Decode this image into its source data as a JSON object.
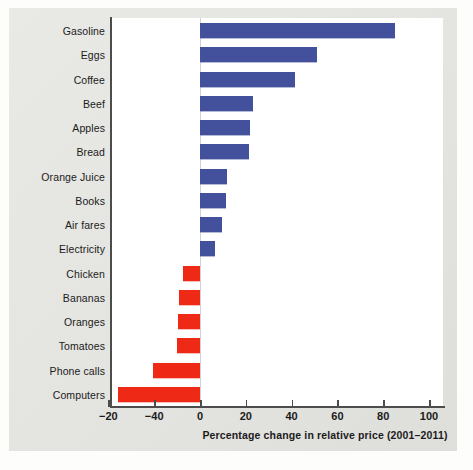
{
  "chart_data": {
    "type": "bar",
    "orientation": "horizontal",
    "title": "",
    "xlabel": "Percentage change in relative price (2001–2011)",
    "ylabel": "",
    "xlim": [
      -45,
      105
    ],
    "grid": false,
    "legend": null,
    "zero_reference_line": true,
    "axis_tick_labels": [
      "−20",
      "−40",
      "0",
      "20",
      "40",
      "60",
      "80",
      "100"
    ],
    "axis_tick_values": [
      -40,
      -20,
      0,
      20,
      40,
      60,
      80,
      100
    ],
    "colors": {
      "positive": "#43509c",
      "negative": "#ee2a17",
      "panel_background": "#e6e6e2",
      "plot_background": "#ffffff",
      "axis": "#4c4c4c"
    },
    "categories": [
      "Gasoline",
      "Eggs",
      "Coffee",
      "Beef",
      "Apples",
      "Bread",
      "Orange Juice",
      "Books",
      "Air fares",
      "Electricity",
      "Chicken",
      "Bananas",
      "Oranges",
      "Tomatoes",
      "Phone calls",
      "Computers"
    ],
    "values": [
      85,
      51,
      41.5,
      23,
      22,
      21.5,
      12,
      11.5,
      9.5,
      6.5,
      -7.5,
      -9,
      -9.5,
      -10,
      -20.5,
      -36
    ],
    "points": [
      {
        "label": "Gasoline",
        "value": 85,
        "sign": "positive"
      },
      {
        "label": "Eggs",
        "value": 51,
        "sign": "positive"
      },
      {
        "label": "Coffee",
        "value": 41.5,
        "sign": "positive"
      },
      {
        "label": "Beef",
        "value": 23,
        "sign": "positive"
      },
      {
        "label": "Apples",
        "value": 22,
        "sign": "positive"
      },
      {
        "label": "Bread",
        "value": 21.5,
        "sign": "positive"
      },
      {
        "label": "Orange Juice",
        "value": 12,
        "sign": "positive"
      },
      {
        "label": "Books",
        "value": 11.5,
        "sign": "positive"
      },
      {
        "label": "Air fares",
        "value": 9.5,
        "sign": "positive"
      },
      {
        "label": "Electricity",
        "value": 6.5,
        "sign": "positive"
      },
      {
        "label": "Chicken",
        "value": -7.5,
        "sign": "negative"
      },
      {
        "label": "Bananas",
        "value": -9,
        "sign": "negative"
      },
      {
        "label": "Oranges",
        "value": -9.5,
        "sign": "negative"
      },
      {
        "label": "Tomatoes",
        "value": -10,
        "sign": "negative"
      },
      {
        "label": "Phone calls",
        "value": -20.5,
        "sign": "negative"
      },
      {
        "label": "Computers",
        "value": -36,
        "sign": "negative"
      }
    ]
  }
}
